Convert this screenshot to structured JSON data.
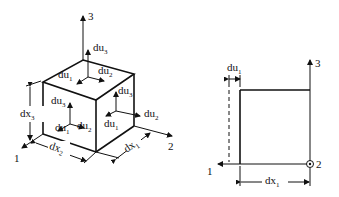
{
  "diagram": {
    "left_cube": {
      "axes": [
        {
          "id": "1",
          "label": "1"
        },
        {
          "id": "2",
          "label": "2"
        },
        {
          "id": "3",
          "label": "3"
        }
      ],
      "dimensions": [
        {
          "base": "dx",
          "sub": "1"
        },
        {
          "base": "dx",
          "sub": "2"
        },
        {
          "base": "dx",
          "sub": "3"
        }
      ],
      "top_face": {
        "du1": {
          "base": "du",
          "sub": "1"
        },
        "du2": {
          "base": "du",
          "sub": "2"
        },
        "du3": {
          "base": "du",
          "sub": "3"
        }
      },
      "front_face": {
        "du1": {
          "base": "du",
          "sub": "1"
        },
        "du2": {
          "base": "du",
          "sub": "2"
        },
        "du3": {
          "base": "du",
          "sub": "3"
        }
      },
      "side_face": {
        "du1": {
          "base": "du",
          "sub": "1"
        },
        "du2": {
          "base": "du",
          "sub": "2"
        },
        "du3": {
          "base": "du",
          "sub": "3"
        }
      }
    },
    "right_view": {
      "axes": [
        {
          "id": "1",
          "label": "1"
        },
        {
          "id": "2",
          "label": "2"
        },
        {
          "id": "3",
          "label": "3"
        }
      ],
      "displacement": {
        "base": "du",
        "sub": "1"
      },
      "width": {
        "base": "dx",
        "sub": "1"
      }
    }
  }
}
